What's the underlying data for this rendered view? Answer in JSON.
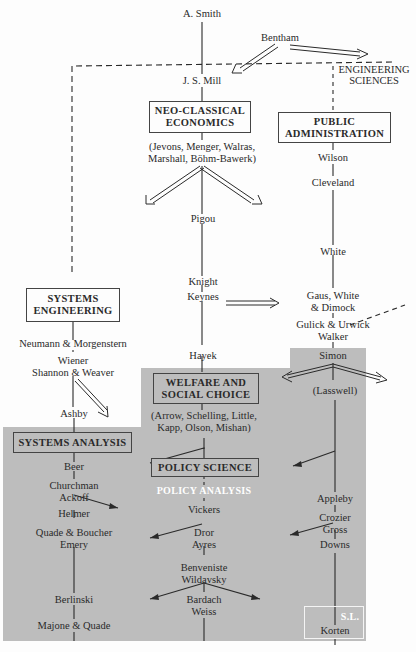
{
  "colors": {
    "shade": "#bdbdbd",
    "ink": "#2a2a2a",
    "box_fill_shaded": "#bdbdbd"
  },
  "people": {
    "smith": "A. Smith",
    "bentham": "Bentham",
    "mill": "J. S. Mill",
    "neoclassical_names_1": "(Jevons, Menger, Walras,",
    "neoclassical_names_2": "Marshall, Böhm-Bawerk)",
    "pigou": "Pigou",
    "knight": "Knight",
    "keynes": "Keynes",
    "hayek": "Hayek",
    "welfare_names_1": "(Arrow, Schelling, Little,",
    "welfare_names_2": "Kapp, Olson, Mishan)",
    "vickers": "Vickers",
    "dror": "Dror",
    "ayres": "Ayres",
    "benveniste": "Benveniste",
    "wildavsky": "Wildavsky",
    "bardach": "Bardach",
    "weiss": "Weiss",
    "wilson": "Wilson",
    "cleveland": "Cleveland",
    "white": "White",
    "gaus_1": "Gaus, White",
    "gaus_2": "& Dimock",
    "gulick_1": "Gulick & Urwick",
    "gulick_2": "Walker",
    "simon": "Simon",
    "lasswell": "(Lasswell)",
    "appleby": "Appleby",
    "crozier": "Crozier",
    "gross": "Gross",
    "downs": "Downs",
    "korten": "Korten",
    "neumann": "Neumann & Morgenstern",
    "wiener": "Wiener",
    "shannon": "Shannon & Weaver",
    "ashby": "Ashby",
    "beer": "Beer",
    "churchman": "Churchman",
    "ackoff": "Ackoff",
    "helmer": "Helmer",
    "quade_boucher": "Quade & Boucher",
    "emery": "Emery",
    "berlinski": "Berlinski",
    "majone": "Majone & Quade"
  },
  "boxes": {
    "neoclassical_1": "NEO-CLASSICAL",
    "neoclassical_2": "ECONOMICS",
    "public_admin_1": "PUBLIC",
    "public_admin_2": "ADMINISTRATION",
    "systems_eng_1": "SYSTEMS",
    "systems_eng_2": "ENGINEERING",
    "welfare_1": "WELFARE AND",
    "welfare_2": "SOCIAL CHOICE",
    "systems_analysis": "SYSTEMS ANALYSIS",
    "policy_science": "POLICY SCIENCE"
  },
  "labels": {
    "engineering_1": "ENGINEERING",
    "engineering_2": "SCIENCES",
    "policy_analysis": "POLICY ANALYSIS",
    "sl": "S.L."
  }
}
